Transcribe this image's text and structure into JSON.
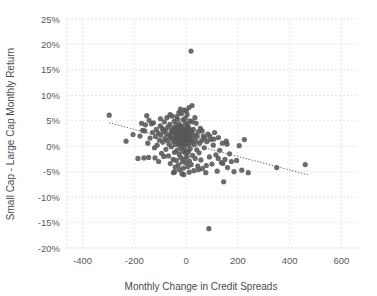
{
  "chart_data": {
    "type": "scatter",
    "title": "",
    "xlabel": "Monthly Change in Credit Spreads",
    "ylabel": "Small Cap - Large Cap Monthly Return",
    "xlim": [
      -460,
      660
    ],
    "ylim": [
      -20,
      25
    ],
    "xticks": [
      -400,
      -200,
      0,
      200,
      400,
      600
    ],
    "xtick_labels": [
      "-400",
      "-200",
      "0",
      "200",
      "400",
      "600"
    ],
    "yticks": [
      -20,
      -15,
      -10,
      -5,
      0,
      5,
      10,
      15,
      20,
      25
    ],
    "ytick_labels": [
      "-20%",
      "-15%",
      "-10%",
      "-5%",
      "0%",
      "5%",
      "10%",
      "15%",
      "20%",
      "25%"
    ],
    "grid": true,
    "legend": "none",
    "marker_color": "#575759",
    "trendline": {
      "type": "linear",
      "color": "#6b6b6d",
      "style": "dotted",
      "x_start": -297,
      "y_start": 4.6,
      "x_end": 470,
      "y_end": -5.6,
      "slope_per_100bp": -1.33,
      "intercept": 0.65
    },
    "points": [
      [
        -297,
        6.1
      ],
      [
        -232,
        1.0
      ],
      [
        -205,
        2.3
      ],
      [
        -186,
        -2.4
      ],
      [
        -178,
        2.0
      ],
      [
        -172,
        4.5
      ],
      [
        -168,
        3.1
      ],
      [
        -163,
        -2.3
      ],
      [
        -157,
        4.2
      ],
      [
        -152,
        6.0
      ],
      [
        -148,
        0.6
      ],
      [
        -143,
        5.1
      ],
      [
        -139,
        1.6
      ],
      [
        -134,
        4.4
      ],
      [
        -130,
        2.7
      ],
      [
        -126,
        4.6
      ],
      [
        -122,
        -0.3
      ],
      [
        -118,
        1.9
      ],
      [
        -115,
        3.3
      ],
      [
        -112,
        0.2
      ],
      [
        -108,
        2.6
      ],
      [
        -106,
        -3.0
      ],
      [
        -103,
        1.2
      ],
      [
        -100,
        4.0
      ],
      [
        -98,
        2.2
      ],
      [
        -95,
        -1.4
      ],
      [
        -92,
        3.5
      ],
      [
        -90,
        0.8
      ],
      [
        -88,
        2.9
      ],
      [
        -86,
        -2.0
      ],
      [
        -84,
        4.8
      ],
      [
        -82,
        1.5
      ],
      [
        -80,
        3.2
      ],
      [
        -78,
        -0.6
      ],
      [
        -76,
        2.4
      ],
      [
        -74,
        5.6
      ],
      [
        -72,
        1.1
      ],
      [
        -70,
        3.8
      ],
      [
        -68,
        -1.9
      ],
      [
        -66,
        0.4
      ],
      [
        -65,
        2.1
      ],
      [
        -63,
        4.3
      ],
      [
        -61,
        -3.4
      ],
      [
        -60,
        1.7
      ],
      [
        -58,
        3.0
      ],
      [
        -57,
        -0.1
      ],
      [
        -55,
        2.6
      ],
      [
        -54,
        5.9
      ],
      [
        -52,
        1.3
      ],
      [
        -51,
        3.6
      ],
      [
        -50,
        -2.6
      ],
      [
        -48,
        0.9
      ],
      [
        -47,
        2.8
      ],
      [
        -46,
        4.9
      ],
      [
        -45,
        -1.2
      ],
      [
        -44,
        1.8
      ],
      [
        -43,
        3.4
      ],
      [
        -42,
        -4.1
      ],
      [
        -41,
        0.3
      ],
      [
        -40,
        2.3
      ],
      [
        -39,
        4.1
      ],
      [
        -38,
        -2.8
      ],
      [
        -37,
        1.4
      ],
      [
        -36,
        3.1
      ],
      [
        -35,
        -0.8
      ],
      [
        -34,
        2.5
      ],
      [
        -33,
        5.3
      ],
      [
        -32,
        1.0
      ],
      [
        -31,
        3.7
      ],
      [
        -30,
        -3.7
      ],
      [
        -30,
        0.6
      ],
      [
        -29,
        2.0
      ],
      [
        -28,
        4.4
      ],
      [
        -27,
        -1.6
      ],
      [
        -26,
        1.6
      ],
      [
        -26,
        3.3
      ],
      [
        -25,
        -4.6
      ],
      [
        -24,
        0.1
      ],
      [
        -23,
        2.2
      ],
      [
        -22,
        4.0
      ],
      [
        -21,
        -2.2
      ],
      [
        -21,
        1.2
      ],
      [
        -20,
        3.5
      ],
      [
        -19,
        -0.4
      ],
      [
        -18,
        2.7
      ],
      [
        -18,
        6.4
      ],
      [
        -17,
        0.7
      ],
      [
        -16,
        3.9
      ],
      [
        -15,
        -3.1
      ],
      [
        -15,
        1.5
      ],
      [
        -14,
        2.9
      ],
      [
        -13,
        -1.0
      ],
      [
        -12,
        2.4
      ],
      [
        -12,
        5.2
      ],
      [
        -11,
        0.5
      ],
      [
        -10,
        3.2
      ],
      [
        -10,
        -4.3
      ],
      [
        -9,
        1.9
      ],
      [
        -8,
        2.6
      ],
      [
        -8,
        -0.2
      ],
      [
        -7,
        7.1
      ],
      [
        -6,
        1.1
      ],
      [
        -6,
        3.4
      ],
      [
        -5,
        -2.5
      ],
      [
        -4,
        0.8
      ],
      [
        -4,
        2.1
      ],
      [
        -3,
        4.6
      ],
      [
        -2,
        -1.4
      ],
      [
        -2,
        1.7
      ],
      [
        -1,
        3.0
      ],
      [
        0,
        -3.3
      ],
      [
        0,
        0.4
      ],
      [
        1,
        2.3
      ],
      [
        1,
        6.9
      ],
      [
        2,
        -0.9
      ],
      [
        3,
        1.4
      ],
      [
        3,
        3.8
      ],
      [
        4,
        -2.0
      ],
      [
        5,
        0.9
      ],
      [
        5,
        2.8
      ],
      [
        6,
        4.2
      ],
      [
        7,
        -4.0
      ],
      [
        7,
        1.3
      ],
      [
        8,
        2.5
      ],
      [
        9,
        -1.1
      ],
      [
        10,
        0.2
      ],
      [
        10,
        3.6
      ],
      [
        11,
        7.6
      ],
      [
        12,
        1.8
      ],
      [
        13,
        -2.9
      ],
      [
        14,
        2.0
      ],
      [
        15,
        5.0
      ],
      [
        16,
        -0.5
      ],
      [
        17,
        1.2
      ],
      [
        18,
        3.1
      ],
      [
        19,
        18.7
      ],
      [
        20,
        -3.6
      ],
      [
        21,
        0.7
      ],
      [
        22,
        2.6
      ],
      [
        23,
        8.0
      ],
      [
        25,
        -1.8
      ],
      [
        26,
        1.5
      ],
      [
        28,
        3.3
      ],
      [
        30,
        -4.8
      ],
      [
        31,
        0.3
      ],
      [
        33,
        2.2
      ],
      [
        35,
        -2.4
      ],
      [
        37,
        1.0
      ],
      [
        39,
        4.5
      ],
      [
        41,
        -0.7
      ],
      [
        43,
        1.9
      ],
      [
        45,
        -3.9
      ],
      [
        47,
        2.8
      ],
      [
        50,
        -1.3
      ],
      [
        52,
        0.6
      ],
      [
        55,
        3.5
      ],
      [
        57,
        -2.7
      ],
      [
        60,
        1.1
      ],
      [
        63,
        -4.4
      ],
      [
        66,
        2.0
      ],
      [
        70,
        -0.3
      ],
      [
        73,
        1.6
      ],
      [
        76,
        -5.2
      ],
      [
        80,
        0.9
      ],
      [
        84,
        2.4
      ],
      [
        88,
        -16.2
      ],
      [
        90,
        -2.1
      ],
      [
        95,
        1.3
      ],
      [
        100,
        -3.5
      ],
      [
        105,
        0.2
      ],
      [
        110,
        2.7
      ],
      [
        115,
        -1.7
      ],
      [
        120,
        -4.9
      ],
      [
        125,
        1.7
      ],
      [
        130,
        -0.8
      ],
      [
        136,
        -3.2
      ],
      [
        140,
        0.6
      ],
      [
        145,
        -7.0
      ],
      [
        150,
        -2.6
      ],
      [
        155,
        1.0
      ],
      [
        160,
        -4.2
      ],
      [
        168,
        -1.5
      ],
      [
        175,
        -3.0
      ],
      [
        185,
        -5.0
      ],
      [
        195,
        -2.8
      ],
      [
        205,
        0.1
      ],
      [
        215,
        -4.7
      ],
      [
        225,
        1.3
      ],
      [
        240,
        -5.2
      ],
      [
        350,
        -4.2
      ],
      [
        460,
        -3.6
      ],
      [
        -160,
        3.0
      ],
      [
        -145,
        -2.2
      ],
      [
        -120,
        -2.3
      ],
      [
        -99,
        5.4
      ],
      [
        -62,
        6.2
      ],
      [
        -49,
        -5.2
      ],
      [
        -44,
        -5.0
      ],
      [
        -36,
        5.8
      ],
      [
        -28,
        6.6
      ],
      [
        -22,
        7.3
      ],
      [
        -16,
        -5.4
      ],
      [
        -9,
        -5.6
      ],
      [
        -3,
        5.5
      ],
      [
        4,
        6.2
      ],
      [
        12,
        -5.1
      ],
      [
        24,
        4.8
      ],
      [
        34,
        5.6
      ],
      [
        48,
        -4.6
      ],
      [
        62,
        3.0
      ],
      [
        78,
        -3.8
      ],
      [
        92,
        2.0
      ],
      [
        108,
        1.4
      ],
      [
        124,
        -2.4
      ],
      [
        142,
        -3.4
      ],
      [
        158,
        0.4
      ]
    ]
  }
}
